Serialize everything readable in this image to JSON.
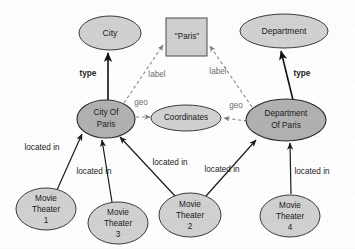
{
  "diagram": {
    "background_color": "#fdfdfd",
    "node_fill_light": "#d0d0d0",
    "node_fill_dark": "#b0b0b0",
    "edge_color_solid": "#111111",
    "edge_color_dashed": "#8a8a8a"
  },
  "nodes": {
    "city_class": {
      "label": "City",
      "shape": "ellipse",
      "fill": "light",
      "cx": 110,
      "cy": 33,
      "rx": 31,
      "ry": 17
    },
    "paris_literal": {
      "label": "\"Paris\"",
      "shape": "rectangle",
      "fill": "light",
      "x": 166,
      "y": 18,
      "w": 41,
      "h": 38
    },
    "department_class": {
      "label": "Department",
      "shape": "ellipse",
      "fill": "light",
      "cx": 284,
      "cy": 31,
      "rx": 44,
      "ry": 17
    },
    "city_of_paris": {
      "label_line1": "City Of",
      "label_line2": "Paris",
      "shape": "ellipse",
      "fill": "dark",
      "cx": 106,
      "cy": 119,
      "rx": 29,
      "ry": 19
    },
    "coordinates": {
      "label": "Coordinates",
      "shape": "ellipse",
      "fill": "light",
      "cx": 186,
      "cy": 118,
      "rx": 35,
      "ry": 13
    },
    "department_of_paris": {
      "label_line1": "Department",
      "label_line2": "Of Paris",
      "shape": "ellipse",
      "fill": "dark",
      "cx": 286,
      "cy": 120,
      "rx": 40,
      "ry": 21
    },
    "movie_theater_1": {
      "label_line1": "Movie",
      "label_line2": "Theater",
      "label_line3": "1",
      "shape": "ellipse",
      "fill": "light",
      "cx": 46,
      "cy": 209,
      "rx": 30,
      "ry": 21
    },
    "movie_theater_3": {
      "label_line1": "Movie",
      "label_line2": "Theater",
      "label_line3": "3",
      "shape": "ellipse",
      "fill": "light",
      "cx": 118,
      "cy": 223,
      "rx": 30,
      "ry": 21
    },
    "movie_theater_2": {
      "label_line1": "Movie",
      "label_line2": "Theater",
      "label_line3": "2",
      "shape": "ellipse",
      "fill": "light",
      "cx": 190,
      "cy": 215,
      "rx": 31,
      "ry": 22
    },
    "movie_theater_4": {
      "label_line1": "Movie",
      "label_line2": "Theater",
      "label_line3": "4",
      "shape": "ellipse",
      "fill": "light",
      "cx": 290,
      "cy": 216,
      "rx": 30,
      "ry": 21
    }
  },
  "edges": [
    {
      "id": "type-city",
      "label": "type",
      "style": "solid",
      "bold": true,
      "from": "city_of_paris",
      "to": "city_class",
      "label_x": 88,
      "label_y": 74
    },
    {
      "id": "type-department",
      "label": "type",
      "style": "solid",
      "bold": true,
      "from": "department_of_paris",
      "to": "department_class",
      "label_x": 302,
      "label_y": 74
    },
    {
      "id": "label-city",
      "label": "label",
      "style": "dashed",
      "bold": false,
      "from": "city_of_paris",
      "to": "paris_literal",
      "label_x": 157,
      "label_y": 75
    },
    {
      "id": "label-department",
      "label": "label",
      "style": "dashed",
      "bold": false,
      "from": "department_of_paris",
      "to": "paris_literal",
      "label_x": 218,
      "label_y": 72
    },
    {
      "id": "geo-city",
      "label": "geo",
      "style": "dashed",
      "bold": false,
      "from": "city_of_paris",
      "to": "coordinates",
      "label_x": 141,
      "label_y": 103
    },
    {
      "id": "geo-department",
      "label": "geo",
      "style": "dashed",
      "bold": false,
      "from": "department_of_paris",
      "to": "coordinates",
      "label_x": 236,
      "label_y": 106
    },
    {
      "id": "located-in-1",
      "label": "located in",
      "style": "solid",
      "bold": false,
      "from": "movie_theater_1",
      "to": "city_of_paris",
      "label_x": 42,
      "label_y": 148
    },
    {
      "id": "located-in-3",
      "label": "located in",
      "style": "solid",
      "bold": false,
      "from": "movie_theater_3",
      "to": "city_of_paris",
      "label_x": 94,
      "label_y": 172
    },
    {
      "id": "located-in-2-city",
      "label": "located in",
      "style": "solid",
      "bold": false,
      "from": "movie_theater_2",
      "to": "city_of_paris",
      "label_x": 170,
      "label_y": 163
    },
    {
      "id": "located-in-2-department",
      "label": "located in",
      "style": "solid",
      "bold": false,
      "from": "movie_theater_2",
      "to": "department_of_paris",
      "label_x": 222,
      "label_y": 170
    },
    {
      "id": "located-in-4",
      "label": "located in",
      "style": "solid",
      "bold": false,
      "from": "movie_theater_4",
      "to": "department_of_paris",
      "label_x": 312,
      "label_y": 172
    }
  ]
}
